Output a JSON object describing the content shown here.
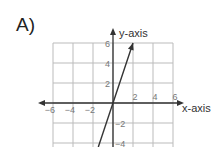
{
  "figure_label": "A)",
  "chart_data": {
    "type": "line",
    "title": "",
    "xlabel": "x-axis",
    "ylabel": "y-axis",
    "xlim": [
      -6,
      6
    ],
    "ylim": [
      -4.4,
      6
    ],
    "grid": true,
    "x_ticks": [
      "-6",
      "-4",
      "-2",
      "2",
      "4",
      "6"
    ],
    "y_ticks": [
      "6",
      "4",
      "2",
      "-2",
      "-4"
    ],
    "series": [
      {
        "name": "line",
        "equation": "y = 3x",
        "x": [
          -1.47,
          0,
          2
        ],
        "y": [
          -4.4,
          0,
          6
        ],
        "end_arrow": "top"
      }
    ]
  },
  "colors": {
    "grid": "#bbbbbb",
    "axis": "#333333",
    "line": "#333333"
  }
}
